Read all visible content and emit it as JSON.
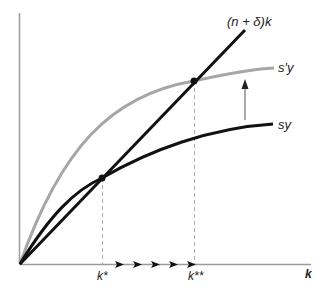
{
  "diagram": {
    "axes": {
      "x_label": "k",
      "origin": [
        20,
        264
      ]
    },
    "curves": [
      {
        "id": "depreciation-line",
        "label": "(n + δ)k",
        "color": "#111111"
      },
      {
        "id": "new-saving-curve",
        "label": "s′y",
        "color": "#a6a6a6"
      },
      {
        "id": "old-saving-curve",
        "label": "sy",
        "color": "#111111"
      }
    ],
    "points": [
      {
        "id": "old-steady-state",
        "label": "k*"
      },
      {
        "id": "new-steady-state",
        "label": "k**"
      }
    ],
    "annotations": {
      "shift_arrow": "upward shift from sy to s′y",
      "transition_arrows": 5
    }
  },
  "labels": {
    "line": "(n + δ)k",
    "s_prime_y": "s′y",
    "sy": "sy",
    "k_star": "k*",
    "k_star_star": "k**",
    "k_axis": "k"
  },
  "colors": {
    "axis": "#9a9a9a",
    "dark": "#111111",
    "gray_curve": "#a6a6a6",
    "dashed": "#9a9a9a"
  }
}
